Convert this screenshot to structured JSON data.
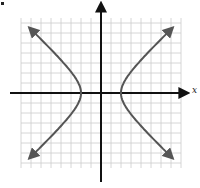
{
  "chart_data": {
    "type": "line",
    "title": "",
    "xlabel": "x",
    "ylabel": "",
    "grid": true,
    "xlim": [
      -8,
      8
    ],
    "ylim": [
      -7.5,
      7.5
    ],
    "grid_spacing": 1,
    "origin_px": [
      101,
      93
    ],
    "unit_px": 10,
    "series": [
      {
        "name": "right branch",
        "vertex": [
          2,
          0
        ],
        "x": [
          6.2,
          4.5,
          3.2,
          2.4,
          2.0,
          2.4,
          3.2,
          4.5,
          6.2
        ],
        "y": [
          6,
          4,
          2.5,
          1.3,
          0,
          -1.3,
          -2.5,
          -4,
          -6
        ]
      },
      {
        "name": "left branch",
        "vertex": [
          -2,
          0
        ],
        "x": [
          -6.2,
          -4.5,
          -3.2,
          -2.4,
          -2.0,
          -2.4,
          -3.2,
          -4.5,
          -6.2
        ],
        "y": [
          6,
          4,
          2.5,
          1.3,
          0,
          -1.3,
          -2.5,
          -4,
          -6
        ]
      }
    ],
    "colors": {
      "curve": "#555555",
      "axis": "#111111",
      "grid": "#cccccc"
    }
  },
  "labels": {
    "x_axis": "x"
  }
}
